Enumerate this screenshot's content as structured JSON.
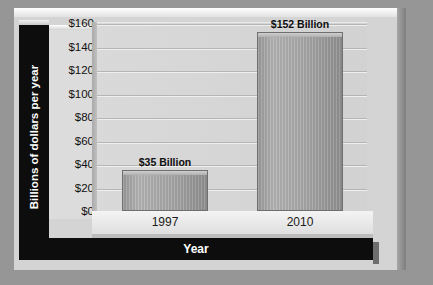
{
  "chart_data": {
    "type": "bar",
    "title": "",
    "xlabel": "Year",
    "ylabel": "Billions of dollars per year",
    "categories": [
      "1997",
      "2010"
    ],
    "values": [
      35,
      152
    ],
    "data_labels": [
      "$35 Billion",
      "$152 Billion"
    ],
    "ylim": [
      0,
      160
    ],
    "ytick_step": 20,
    "yticks": [
      "$160",
      "$140",
      "$120",
      "$100",
      "$80",
      "$60",
      "$40",
      "$20",
      "$0"
    ],
    "ytick_values": [
      160,
      140,
      120,
      100,
      80,
      60,
      40,
      20,
      0
    ],
    "grid": true,
    "legend": false,
    "legend_position": "none",
    "units": "billions of dollars per year",
    "series": [
      {
        "name": "Amount",
        "values": [
          35,
          152
        ]
      }
    ]
  },
  "colors": {
    "page_background": "#969696",
    "plaque_face": "#d4d4d4",
    "plot_background": "#d6d6d6",
    "band_background": "#0d0d0d",
    "band_text": "#ffffff",
    "bar_fill": "#a8a8a8",
    "bar_outline": "#6f6f6f",
    "gridline": "#a9a9a9",
    "tick_text": "#111111"
  },
  "axis": {
    "y_title": "Billions of dollars per year",
    "x_title": "Year"
  },
  "bars": [
    {
      "category": "1997",
      "value": 35,
      "label": "$35 Billion"
    },
    {
      "category": "2010",
      "value": 152,
      "label": "$152 Billion"
    }
  ]
}
